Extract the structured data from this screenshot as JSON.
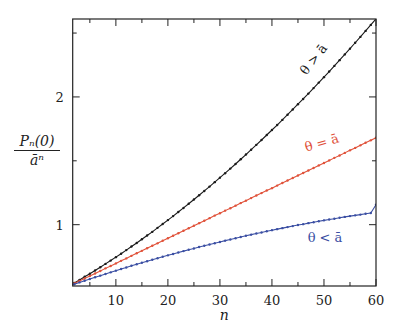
{
  "chart_data": {
    "type": "line",
    "title": "",
    "xlabel": "n",
    "ylabel": "P_n(0) / ā^n",
    "ylabel_parts": {
      "numerator": "Pₙ(0)",
      "denominator": "āⁿ"
    },
    "xlim": [
      1.7,
      60
    ],
    "ylim": [
      0.52,
      2.61
    ],
    "x_ticks": [
      10,
      20,
      30,
      40,
      50,
      60
    ],
    "x_minor_ticks": [
      5,
      15,
      25,
      35,
      45,
      55
    ],
    "y_ticks": [
      1,
      2
    ],
    "y_minor_ticks": [
      1.5,
      2.5
    ],
    "grid": false,
    "legend": "inline labels",
    "series": [
      {
        "name": "θ > ā",
        "color": "#1a1a1a",
        "x": [
          1,
          2,
          3,
          4,
          5,
          6,
          7,
          8,
          9,
          10,
          11,
          12,
          13,
          14,
          15,
          16,
          17,
          18,
          19,
          20,
          21,
          22,
          23,
          24,
          25,
          26,
          27,
          28,
          29,
          30,
          31,
          32,
          33,
          34,
          35,
          36,
          37,
          38,
          39,
          40,
          41,
          42,
          43,
          44,
          45,
          46,
          47,
          48,
          49,
          50,
          51,
          52,
          53,
          54,
          55,
          56,
          57,
          58,
          59,
          60
        ],
        "values": [
          0.52,
          0.543,
          0.567,
          0.592,
          0.616,
          0.641,
          0.667,
          0.693,
          0.719,
          0.746,
          0.773,
          0.801,
          0.829,
          0.857,
          0.886,
          0.915,
          0.944,
          0.975,
          1.005,
          1.036,
          1.067,
          1.099,
          1.131,
          1.164,
          1.197,
          1.23,
          1.264,
          1.298,
          1.333,
          1.368,
          1.403,
          1.439,
          1.475,
          1.512,
          1.549,
          1.587,
          1.625,
          1.663,
          1.702,
          1.741,
          1.78,
          1.82,
          1.861,
          1.902,
          1.943,
          1.984,
          2.026,
          2.069,
          2.112,
          2.155,
          2.199,
          2.243,
          2.288,
          2.333,
          2.378,
          2.424,
          2.47,
          2.517,
          2.564,
          2.611
        ]
      },
      {
        "name": "θ = ā",
        "color": "#e0523a",
        "x": [
          1,
          2,
          3,
          4,
          5,
          6,
          7,
          8,
          9,
          10,
          11,
          12,
          13,
          14,
          15,
          16,
          17,
          18,
          19,
          20,
          21,
          22,
          23,
          24,
          25,
          26,
          27,
          28,
          29,
          30,
          31,
          32,
          33,
          34,
          35,
          36,
          37,
          38,
          39,
          40,
          41,
          42,
          43,
          44,
          45,
          46,
          47,
          48,
          49,
          50,
          51,
          52,
          53,
          54,
          55,
          56,
          57,
          58,
          59,
          60
        ],
        "values": [
          0.52,
          0.54,
          0.559,
          0.579,
          0.599,
          0.618,
          0.638,
          0.658,
          0.677,
          0.697,
          0.717,
          0.736,
          0.756,
          0.776,
          0.795,
          0.815,
          0.835,
          0.854,
          0.874,
          0.894,
          0.913,
          0.933,
          0.953,
          0.972,
          0.992,
          1.012,
          1.031,
          1.051,
          1.071,
          1.09,
          1.11,
          1.129,
          1.149,
          1.169,
          1.188,
          1.208,
          1.228,
          1.247,
          1.267,
          1.286,
          1.306,
          1.326,
          1.346,
          1.365,
          1.385,
          1.405,
          1.424,
          1.444,
          1.464,
          1.483,
          1.503,
          1.523,
          1.542,
          1.562,
          1.582,
          1.601,
          1.621,
          1.641,
          1.66,
          1.68
        ]
      },
      {
        "name": "θ < ā",
        "color": "#3b4fa3",
        "x": [
          1,
          2,
          3,
          4,
          5,
          6,
          7,
          8,
          9,
          10,
          11,
          12,
          13,
          14,
          15,
          16,
          17,
          18,
          19,
          20,
          21,
          22,
          23,
          24,
          25,
          26,
          27,
          28,
          29,
          30,
          31,
          32,
          33,
          34,
          35,
          36,
          37,
          38,
          39,
          40,
          41,
          42,
          43,
          44,
          45,
          46,
          47,
          48,
          49,
          50,
          51,
          52,
          53,
          54,
          55,
          56,
          57,
          58,
          59,
          60
        ],
        "values": [
          0.52,
          0.534,
          0.548,
          0.561,
          0.575,
          0.588,
          0.601,
          0.614,
          0.627,
          0.64,
          0.653,
          0.665,
          0.678,
          0.69,
          0.702,
          0.714,
          0.726,
          0.737,
          0.749,
          0.76,
          0.771,
          0.782,
          0.793,
          0.804,
          0.814,
          0.825,
          0.835,
          0.845,
          0.855,
          0.865,
          0.875,
          0.884,
          0.894,
          0.903,
          0.913,
          0.922,
          0.931,
          0.939,
          0.948,
          0.957,
          0.965,
          0.973,
          0.981,
          0.989,
          0.997,
          1.004,
          1.012,
          1.019,
          1.027,
          1.034,
          1.041,
          1.047,
          1.054,
          1.061,
          1.067,
          1.073,
          1.079,
          1.085,
          1.091,
          1.156
        ]
      }
    ]
  }
}
